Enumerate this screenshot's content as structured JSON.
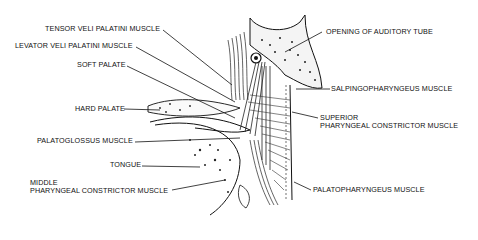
{
  "diagram": {
    "labels_left": [
      {
        "id": "tensor",
        "text": "TENSOR VELI PALATINI MUSCLE"
      },
      {
        "id": "levator",
        "text": "LEVATOR VELI PALATINI MUSCLE"
      },
      {
        "id": "soft_palate",
        "text": "SOFT PALATE"
      },
      {
        "id": "hard_palate",
        "text": "HARD PALATE"
      },
      {
        "id": "palatoglossus",
        "text": "PALATOGLOSSUS MUSCLE"
      },
      {
        "id": "tongue",
        "text": "TONGUE"
      },
      {
        "id": "middle_line1",
        "text": "MIDDLE"
      },
      {
        "id": "middle_line2",
        "text": "PHARYNGEAL CONSTRICTOR MUSCLE"
      }
    ],
    "labels_right": [
      {
        "id": "auditory",
        "text": "OPENING OF AUDITORY TUBE"
      },
      {
        "id": "salpingo",
        "text": "SALPINGOPHARYNGEUS MUSCLE"
      },
      {
        "id": "superior_line1",
        "text": "SUPERIOR"
      },
      {
        "id": "superior_line2",
        "text": "PHARYNGEAL CONSTRICTOR MUSCLE"
      },
      {
        "id": "palatopharyngeus",
        "text": "PALATOPHARYNGEUS MUSCLE"
      }
    ]
  }
}
